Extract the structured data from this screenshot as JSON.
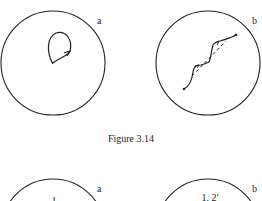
{
  "figure_top": {
    "caption": "Figure 3.14",
    "panel_a": {
      "label": "a",
      "content": "closed loop with arrow"
    },
    "panel_b": {
      "label": "b",
      "content": "stepped path with dashed diagonal"
    }
  },
  "figure_bottom": {
    "panel_a": {
      "label": "a",
      "inner_text": "1"
    },
    "panel_b": {
      "label": "b",
      "inner_text": "1, 2′"
    }
  },
  "colors": {
    "stroke": "#222222",
    "background": "#ffffff"
  }
}
